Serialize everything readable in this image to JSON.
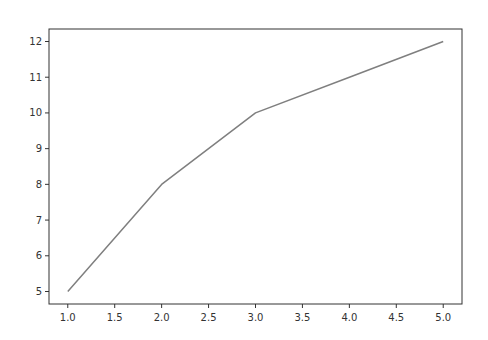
{
  "chart_data": {
    "type": "line",
    "title": "",
    "xlabel": "",
    "ylabel": "",
    "x": [
      1.0,
      2.0,
      3.0,
      4.0,
      5.0
    ],
    "series": [
      {
        "name": "",
        "values": [
          5,
          8,
          10,
          11,
          12
        ],
        "color": "#7f7f7f"
      }
    ],
    "xlim": [
      0.8,
      5.2
    ],
    "ylim": [
      4.65,
      12.35
    ],
    "xticks": [
      "1.0",
      "1.5",
      "2.0",
      "2.5",
      "3.0",
      "3.5",
      "4.0",
      "4.5",
      "5.0"
    ],
    "yticks": [
      "5",
      "6",
      "7",
      "8",
      "9",
      "10",
      "11",
      "12"
    ],
    "grid": false,
    "legend": null
  },
  "colors": {
    "line": "#7f7f7f",
    "axes": "#333333",
    "background": "#ffffff"
  }
}
